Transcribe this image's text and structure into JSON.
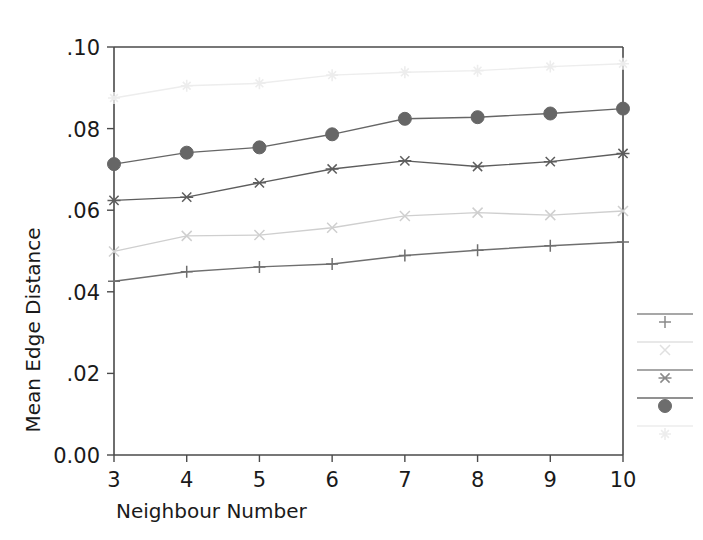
{
  "chart_data": {
    "type": "line",
    "title": "",
    "xlabel": "Neighbour Number",
    "ylabel": "Mean Edge Distance",
    "x": [
      3,
      4,
      5,
      6,
      7,
      8,
      9,
      10
    ],
    "xtick_labels": [
      "3",
      "4",
      "5",
      "6",
      "7",
      "8",
      "9",
      "10"
    ],
    "ytick_labels": [
      "0.00",
      ".02",
      ".04",
      ".06",
      ".08",
      ".10"
    ],
    "ytick_values": [
      0.0,
      0.02,
      0.04,
      0.06,
      0.08,
      0.1
    ],
    "xlim": [
      3,
      10
    ],
    "ylim": [
      0.0,
      0.1
    ],
    "grid": false,
    "legend_position": "right-outside",
    "series": [
      {
        "name": "series-1",
        "marker": "plus",
        "color": "#6f6f6f",
        "values": [
          0.0426,
          0.0449,
          0.0461,
          0.0468,
          0.0489,
          0.0502,
          0.0513,
          0.0522
        ]
      },
      {
        "name": "series-2",
        "marker": "x",
        "color": "#cfcfcf",
        "values": [
          0.0499,
          0.0537,
          0.0539,
          0.0557,
          0.0586,
          0.0594,
          0.0588,
          0.0598
        ]
      },
      {
        "name": "series-3",
        "marker": "asterisk",
        "color": "#5d5d5d",
        "values": [
          0.0624,
          0.0632,
          0.0667,
          0.0701,
          0.0721,
          0.0707,
          0.0719,
          0.0739
        ]
      },
      {
        "name": "series-4",
        "marker": "filled-circle",
        "color": "#666666",
        "values": [
          0.0713,
          0.0741,
          0.0754,
          0.0786,
          0.0824,
          0.0828,
          0.0837,
          0.0849
        ]
      },
      {
        "name": "series-5",
        "marker": "light-star",
        "color": "#ededed",
        "values": [
          0.0875,
          0.0905,
          0.0911,
          0.0931,
          0.0938,
          0.0942,
          0.0952,
          0.0959
        ]
      }
    ]
  },
  "legend": {
    "entries": [
      {
        "marker": "plus",
        "color": "#8a8a8a",
        "label": ""
      },
      {
        "marker": "x",
        "color": "#e0e0e0",
        "label": ""
      },
      {
        "marker": "asterisk",
        "color": "#8a8a8a",
        "label": ""
      },
      {
        "marker": "filled-circle",
        "color": "#6d6d6d",
        "label": ""
      },
      {
        "marker": "light-star",
        "color": "#ededed",
        "label": ""
      }
    ]
  },
  "colors": {
    "background": "#ffffff",
    "axis": "#4a4a4a",
    "text": "#1a1a1a"
  }
}
